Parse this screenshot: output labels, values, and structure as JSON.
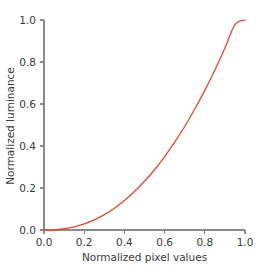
{
  "chart_data": {
    "type": "line",
    "title": "",
    "subtitle": "",
    "xlabel": "Normalized pixel values",
    "ylabel": "Normalized luminance",
    "xlim": [
      0.0,
      1.0
    ],
    "ylim": [
      0.0,
      1.0
    ],
    "xticks": [
      "0.0",
      "0.2",
      "0.4",
      "0.6",
      "0.8",
      "1.0"
    ],
    "yticks": [
      "0.0",
      "0.2",
      "0.4",
      "0.6",
      "0.8",
      "1.0"
    ],
    "xtick_values": [
      0.0,
      0.2,
      0.4,
      0.6,
      0.8,
      1.0
    ],
    "ytick_values": [
      0.0,
      0.2,
      0.4,
      0.6,
      0.8,
      1.0
    ],
    "grid": false,
    "legend": null,
    "legend_position": "none",
    "annotations": [],
    "series": [
      {
        "name": "gamma transfer curve",
        "color": "#e04a2f",
        "linewidth": 1.3,
        "description": "power-law gamma curve, luminance = value^2.2",
        "x": [
          0.0,
          0.05,
          0.1,
          0.15,
          0.2,
          0.25,
          0.3,
          0.35,
          0.4,
          0.45,
          0.5,
          0.55,
          0.6,
          0.65,
          0.7,
          0.75,
          0.8,
          0.85,
          0.9,
          0.95,
          1.0
        ],
        "values": [
          0.0,
          0.001,
          0.006,
          0.015,
          0.029,
          0.048,
          0.073,
          0.104,
          0.14,
          0.183,
          0.232,
          0.287,
          0.349,
          0.418,
          0.493,
          0.576,
          0.665,
          0.762,
          0.866,
          0.978,
          1.0
        ]
      }
    ]
  },
  "colors": {
    "curve": "#e04a2f",
    "axis": "#8a8a8a",
    "text": "#3a3a3a",
    "background": "#ffffff"
  }
}
